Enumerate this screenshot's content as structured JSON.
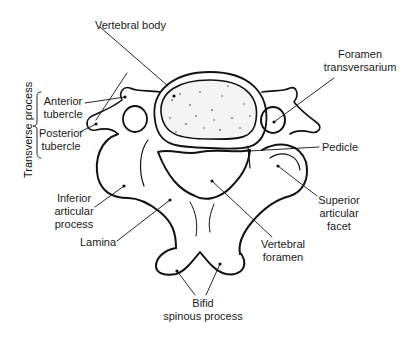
{
  "diagram": {
    "labels": {
      "vertebral_body": "Vertebral body",
      "foramen_transversarium_1": "Foramen",
      "foramen_transversarium_2": "transversarium",
      "transverse_process": "Transverse process",
      "anterior_tubercle_1": "Anterior",
      "anterior_tubercle_2": "tubercle",
      "posterior_tubercle_1": "Posterior",
      "posterior_tubercle_2": "tubercle",
      "pedicle": "Pedicle",
      "inferior_articular_1": "Inferior",
      "inferior_articular_2": "articular",
      "inferior_articular_3": "process",
      "superior_articular_1": "Superior",
      "superior_articular_2": "articular",
      "superior_articular_3": "facet",
      "lamina": "Lamina",
      "vertebral_foramen_1": "Vertebral",
      "vertebral_foramen_2": "foramen",
      "bifid_1": "Bifid",
      "bifid_2": "spinous process"
    },
    "colors": {
      "line": "#111111",
      "background": "#ffffff"
    }
  }
}
